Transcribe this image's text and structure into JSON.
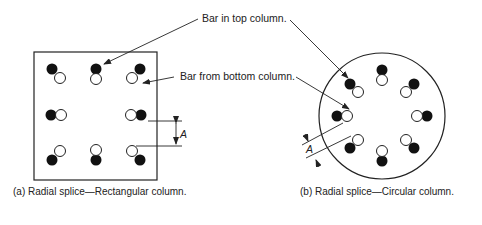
{
  "labels": {
    "bar_top": "Bar in top column.",
    "bar_bottom": "Bar from bottom column.",
    "dim_rect": "A",
    "dim_circ": "A"
  },
  "captions": {
    "a": "(a)  Radial splice—Rectangular column.",
    "b": "(b)  Radial splice—Circular column."
  }
}
